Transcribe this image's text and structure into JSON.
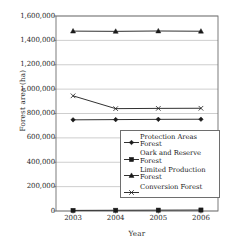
{
  "chart_data": {
    "type": "line",
    "title": "",
    "xlabel": "Year",
    "ylabel": "Forest area (ha)",
    "categories": [
      "2003",
      "2004",
      "2005",
      "2006"
    ],
    "x": [
      2003,
      2004,
      2005,
      2006
    ],
    "xlim": [
      2002.6,
      2006.4
    ],
    "ylim": [
      0,
      1600000
    ],
    "ytick_labels": [
      "0",
      "200,000",
      "400,000",
      "600,000",
      "800,000",
      "1,000,000",
      "1,200,000",
      "1,400,000",
      "1,600,000"
    ],
    "ytick_values": [
      0,
      200000,
      400000,
      600000,
      800000,
      1000000,
      1200000,
      1400000,
      1600000
    ],
    "grid": "horizontal",
    "legend_position": "inside-lower-right",
    "series": [
      {
        "name": "Protection Areas Forest",
        "marker": "diamond",
        "color": "#1a1a1a",
        "values": [
          748000,
          750000,
          752000,
          753000
        ]
      },
      {
        "name": "Oark and Reserve Forest",
        "marker": "square",
        "color": "#1a1a1a",
        "values": [
          5000,
          6000,
          7000,
          8000
        ]
      },
      {
        "name": "Limited Production Forest",
        "marker": "triangle",
        "color": "#1a1a1a",
        "values": [
          1476000,
          1474000,
          1477000,
          1475000
        ]
      },
      {
        "name": "Conversion Forest",
        "marker": "cross",
        "color": "#1a1a1a",
        "values": [
          945000,
          840000,
          842000,
          843000
        ]
      }
    ]
  },
  "axes": {
    "ylabel": "Forest area (ha)",
    "xlabel": "Year"
  },
  "legend": {
    "items": [
      {
        "label_line1": "Protection Areas",
        "label_line2": "Forest",
        "marker": "diamond"
      },
      {
        "label_line1": "Oark and Reserve",
        "label_line2": "Forest",
        "marker": "square"
      },
      {
        "label_line1": "Limited Production",
        "label_line2": "Forest",
        "marker": "triangle"
      },
      {
        "label_line1": "Conversion Forest",
        "label_line2": "",
        "marker": "cross"
      }
    ]
  },
  "colors": {
    "line": "#1a1a1a",
    "grid": "#b9b9b9",
    "frame": "#6e6e6e",
    "background": "#ffffff"
  }
}
